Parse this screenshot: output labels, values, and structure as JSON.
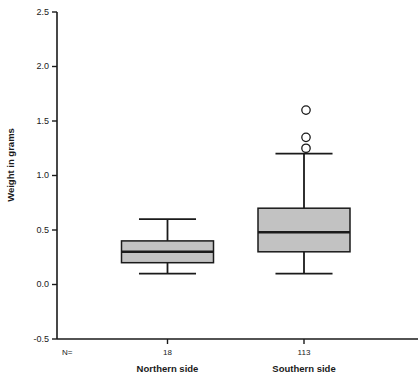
{
  "chart_data": {
    "type": "box",
    "title": "",
    "xlabel": "",
    "ylabel": "Weight in grams",
    "ylim": [
      -0.5,
      2.5
    ],
    "ytick_labels": [
      "2.5",
      "2.0",
      "1.5",
      "1.0",
      "0.5",
      "0.0",
      "-0.5"
    ],
    "ytick_values": [
      2.5,
      2.0,
      1.5,
      1.0,
      0.5,
      0.0,
      -0.5
    ],
    "grid": false,
    "legend": "none",
    "n_header": "N=",
    "categories": [
      "Northern side",
      "Southern side"
    ],
    "counts": [
      "18",
      "113"
    ],
    "boxes": [
      {
        "name": "Northern side",
        "n": 18,
        "whisker_low": 0.1,
        "q1": 0.2,
        "median": 0.3,
        "q3": 0.4,
        "whisker_high": 0.6,
        "outliers": []
      },
      {
        "name": "Southern side",
        "n": 113,
        "whisker_low": 0.1,
        "q1": 0.3,
        "median": 0.48,
        "q3": 0.7,
        "whisker_high": 1.2,
        "outliers": [
          1.25,
          1.35,
          1.6
        ]
      }
    ]
  },
  "colors": {
    "box_fill": "#c2c2c2",
    "line": "#1a1a1a",
    "background": "#ffffff"
  }
}
